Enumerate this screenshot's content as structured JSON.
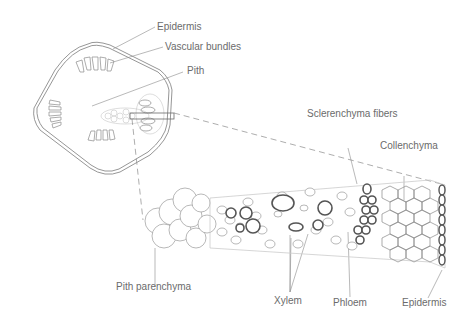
{
  "diagram": {
    "type": "botanical cross-section",
    "overview_labels": {
      "epidermis": "Epidermis",
      "vascular_bundles": "Vascular bundles",
      "pith": "Pith"
    },
    "detail_labels": {
      "sclerenchyma_fibers": "Sclerenchyma fibers",
      "collenchyma": "Collenchyma",
      "pith_parenchyma": "Pith parenchyma",
      "xylem": "Xylem",
      "phloem": "Phloem",
      "epidermis": "Epidermis"
    },
    "colors": {
      "line": "#8a8a8a",
      "thick_wall": "#6a6a6a",
      "text": "#6b6b6b",
      "background": "#ffffff"
    }
  }
}
